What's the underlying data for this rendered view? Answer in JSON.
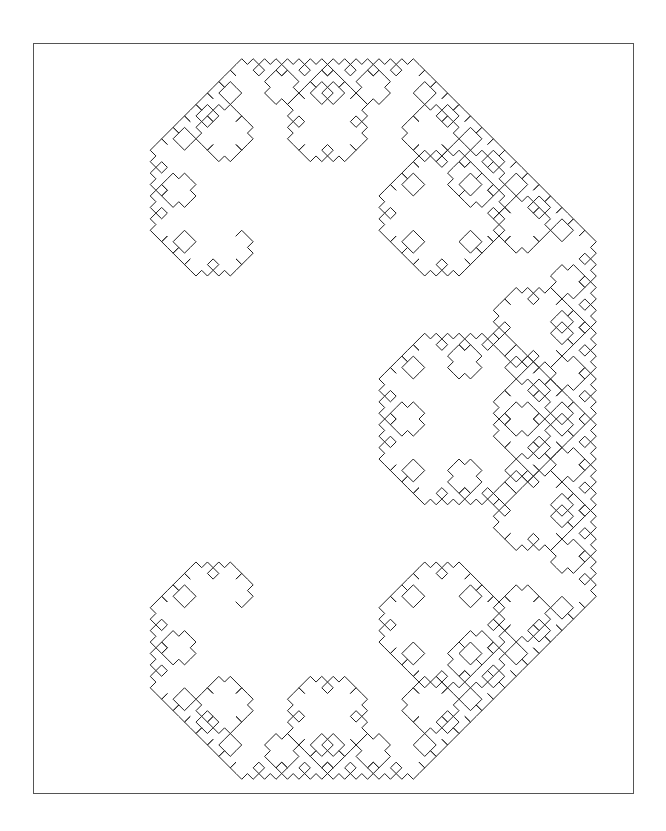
{
  "canvas": {
    "width": 666,
    "height": 831,
    "background": "#ffffff"
  },
  "frame": {
    "x": 33,
    "y": 43,
    "width": 600,
    "height": 750,
    "stroke": "#555555"
  },
  "fractal": {
    "name": "Levy C curve",
    "iterations": 11,
    "start_point": [
      236,
      236
    ],
    "end_point": [
      236,
      602
    ],
    "rotation_deg": -45,
    "stroke": "#222222",
    "stroke_width": 1
  }
}
